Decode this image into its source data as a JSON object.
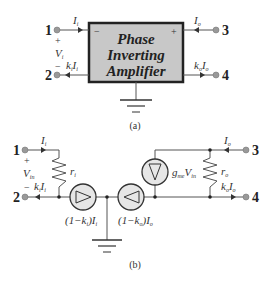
{
  "diagram_a": {
    "box_label_line1": "Phase",
    "box_label_line2": "Inverting",
    "box_label_line3": "Amplifier",
    "box_minus": "−",
    "box_plus": "+",
    "terminal_1": "1",
    "terminal_2": "2",
    "terminal_3": "3",
    "terminal_4": "4",
    "current_in": "I",
    "current_in_sub": "i",
    "current_out": "I",
    "current_out_sub": "o",
    "voltage": "V",
    "voltage_sub": "i",
    "plus_sign": "+",
    "minus_sign": "−",
    "ki_Ii": "k",
    "ki_sub": "i",
    "ki_I": "I",
    "ki_I_sub": "i",
    "ko_Io": "k",
    "ko_sub": "o",
    "ko_I": "I",
    "ko_I_sub": "o",
    "caption": "(a)",
    "colors": {
      "box_fill": "#c8c8c8",
      "box_border": "#222222",
      "terminal": "#999999"
    }
  },
  "diagram_b": {
    "terminal_1": "1",
    "terminal_2": "2",
    "terminal_3": "3",
    "terminal_4": "4",
    "current_in": "I",
    "current_in_sub": "i",
    "current_out": "I",
    "current_out_sub": "o",
    "voltage": "V",
    "voltage_sub": "in",
    "plus_sign": "+",
    "minus_sign": "−",
    "ri": "r",
    "ri_sub": "i",
    "ro": "r",
    "ro_sub": "o",
    "gm_label": "g",
    "gm_sub": "me",
    "gm_V": "V",
    "gm_V_sub": "in",
    "ki_Ii": "k",
    "ki_sub": "i",
    "ki_I": "I",
    "ki_I_sub": "i",
    "ko_Io": "k",
    "ko_sub": "o",
    "ko_I": "I",
    "ko_I_sub": "o",
    "src_left_label": "(1−k",
    "src_left_sub": "i",
    "src_left_tail": ")I",
    "src_left_tail_sub": "i",
    "src_right_label": "(1−k",
    "src_right_sub": "o",
    "src_right_tail": ")I",
    "src_right_tail_sub": "o",
    "caption": "(b)",
    "colors": {
      "source_fill": "#e6e6e6",
      "wire": "#555555"
    }
  }
}
